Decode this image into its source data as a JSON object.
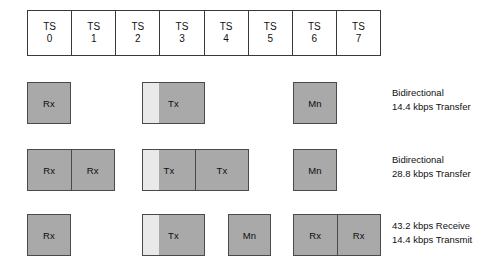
{
  "diagram": {
    "colors": {
      "block_fill": "#a9a9a9",
      "guard_fill": "#e9e9e9",
      "border": "#4a4a4a",
      "table_border": "#3a3a3a",
      "text": "#111111",
      "background": "#ffffff"
    }
  },
  "timeslots": {
    "label_prefix": "TS",
    "cells": [
      {
        "label": "TS",
        "index": "0"
      },
      {
        "label": "TS",
        "index": "1"
      },
      {
        "label": "TS",
        "index": "2"
      },
      {
        "label": "TS",
        "index": "3"
      },
      {
        "label": "TS",
        "index": "4"
      },
      {
        "label": "TS",
        "index": "5"
      },
      {
        "label": "TS",
        "index": "6"
      },
      {
        "label": "TS",
        "index": "7"
      }
    ]
  },
  "rows": [
    {
      "id": "row-1",
      "blocks": [
        {
          "id": "row1-rx",
          "segments": [
            "Rx"
          ],
          "guard": false,
          "start_slot": 0,
          "span": 1
        },
        {
          "id": "row1-tx",
          "segments": [
            "Tx"
          ],
          "guard": true,
          "start_slot": 3,
          "span": 1
        },
        {
          "id": "row1-mn",
          "segments": [
            "Mn"
          ],
          "guard": false,
          "start_slot": 6,
          "span": 1
        }
      ],
      "note": {
        "line1": "Bidirectional",
        "line2": "14.4 kbps Transfer"
      }
    },
    {
      "id": "row-2",
      "blocks": [
        {
          "id": "row2-rx-pair",
          "segments": [
            "Rx",
            "Rx"
          ],
          "guard": false,
          "start_slot": 0,
          "span": 2
        },
        {
          "id": "row2-tx-pair",
          "segments": [
            "Tx",
            "Tx"
          ],
          "guard": true,
          "start_slot": 3,
          "span": 2
        },
        {
          "id": "row2-mn",
          "segments": [
            "Mn"
          ],
          "guard": false,
          "start_slot": 6,
          "span": 1
        }
      ],
      "note": {
        "line1": "Bidirectional",
        "line2": "28.8 kbps Transfer"
      }
    },
    {
      "id": "row-3",
      "blocks": [
        {
          "id": "row3-rx",
          "segments": [
            "Rx"
          ],
          "guard": false,
          "start_slot": 0,
          "span": 1
        },
        {
          "id": "row3-tx",
          "segments": [
            "Tx"
          ],
          "guard": true,
          "start_slot": 3,
          "span": 1
        },
        {
          "id": "row3-mn",
          "segments": [
            "Mn"
          ],
          "guard": false,
          "start_slot": 4.5,
          "span": 1
        },
        {
          "id": "row3-rx-pair",
          "segments": [
            "Rx",
            "Rx"
          ],
          "guard": false,
          "start_slot": 6,
          "span": 2
        }
      ],
      "note": {
        "line1": "43.2 kbps Receive",
        "line2": "14.4 kbps Transmit"
      }
    }
  ]
}
